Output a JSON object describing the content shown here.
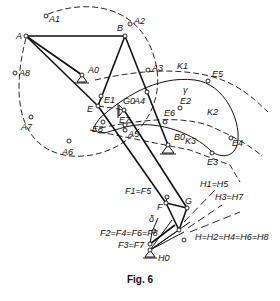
{
  "figure": {
    "caption": "Fig. 6",
    "labels": {
      "A": "A",
      "A1": "A1",
      "A2": "A2",
      "A3": "A3",
      "A4": "A4",
      "A5": "A5",
      "A6": "A6",
      "A7": "A7",
      "A8": "A8",
      "A0": "A0",
      "B": "B",
      "B0": "B0",
      "E": "E",
      "E1": "E1",
      "E2": "E2",
      "E3": "E3",
      "E4": "E4",
      "E5": "E5",
      "E6": "E6",
      "E7": "E7",
      "E8": "E8",
      "G0": "G0",
      "G": "G",
      "K1": "K1",
      "K2": "K2",
      "K3": "K3",
      "gamma": "γ",
      "F": "F",
      "F1F5": "F1=F5",
      "F2F4F6F8": "F2=F4=F6=F8",
      "F3F7": "F3=F7",
      "delta": "δ",
      "H1H5": "H1=H5",
      "H3H7": "H3=H7",
      "H_chain": "H=H2=H4=H6=H8",
      "H0": "H0"
    }
  }
}
